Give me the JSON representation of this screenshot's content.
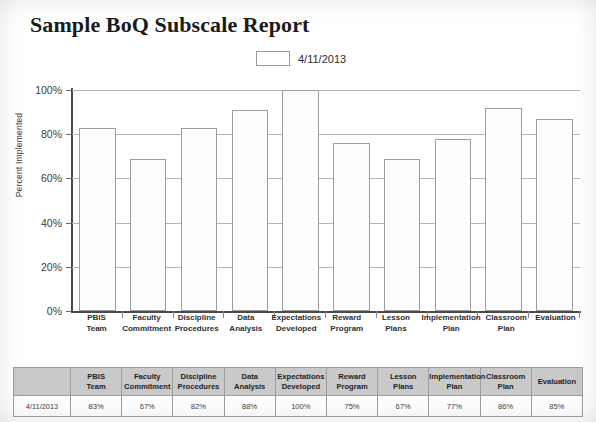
{
  "title": "Sample BoQ Subscale Report",
  "legend": {
    "swatch_name": "series-swatch",
    "label": "4/11/2013"
  },
  "chart_data": {
    "type": "bar",
    "title": "Sample BoQ Subscale Report",
    "xlabel": "",
    "ylabel": "Percent Implemented",
    "ylim": [
      0,
      100
    ],
    "yticks": [
      "0%",
      "20%",
      "40%",
      "60%",
      "80%",
      "100%"
    ],
    "ytick_values": [
      0,
      20,
      40,
      60,
      80,
      100
    ],
    "grid": true,
    "legend_position": "top-center",
    "categories": [
      "PBIS Team",
      "Faculty Commitment",
      "Discipline Procedures",
      "Data Analysis",
      "Expectations Developed",
      "Reward Program",
      "Lesson Plans",
      "Implementation Plan",
      "Classroom Plan",
      "Evaluation"
    ],
    "series": [
      {
        "name": "4/11/2013",
        "values": [
          83,
          69,
          83,
          91,
          100,
          76,
          69,
          78,
          92,
          87
        ]
      }
    ]
  },
  "axis": {
    "y_title": "Percent Implemented",
    "ticks": [
      "100%",
      "80%",
      "60%",
      "40%",
      "20%",
      "0%"
    ]
  },
  "categories_wrapped": [
    [
      "PBIS",
      "Team"
    ],
    [
      "Faculty",
      "Commitment"
    ],
    [
      "Discipline",
      "Procedures"
    ],
    [
      "Data",
      "Analysis"
    ],
    [
      "Expectations",
      "Developed"
    ],
    [
      "Reward",
      "Program"
    ],
    [
      "Lesson",
      "Plans"
    ],
    [
      "Implementation",
      "Plan"
    ],
    [
      "Classroom",
      "Plan"
    ],
    [
      "Evaluation",
      ""
    ]
  ],
  "table": {
    "corner_label": "",
    "headers": [
      "PBIS Team",
      "Faculty Commitment",
      "Discipline Procedures",
      "Data Analysis",
      "Expectations Developed",
      "Reward Program",
      "Lesson Plans",
      "Implementation Plan",
      "Classroom Plan",
      "Evaluation"
    ],
    "rows": [
      {
        "label": "4/11/2013",
        "values": [
          "83%",
          "67%",
          "82%",
          "88%",
          "100%",
          "75%",
          "67%",
          "77%",
          "86%",
          "85%"
        ]
      }
    ]
  },
  "colors": {
    "bar_fill": "#fdfdfd",
    "bar_stroke": "#9d9d9d",
    "gridline": "#b4b4b4",
    "axis": "#4a4a4a",
    "table_header_bg": "#c9c9c9",
    "page_bg": "#ffffff"
  }
}
